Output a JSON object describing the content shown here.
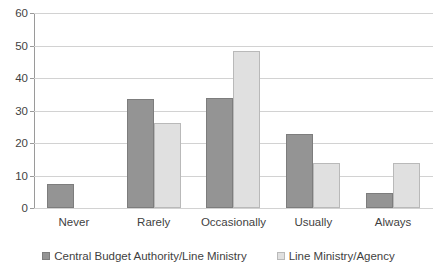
{
  "chart_data": {
    "type": "bar",
    "title": "",
    "xlabel": "",
    "ylabel": "",
    "ylim": [
      0,
      60
    ],
    "ytick_step": 10,
    "yticks": [
      0,
      10,
      20,
      30,
      40,
      50,
      60
    ],
    "grid": true,
    "legend_position": "bottom",
    "categories": [
      "Never",
      "Rarely",
      "Occasionally",
      "Usually",
      "Always"
    ],
    "series": [
      {
        "name": "Central Budget Authority/Line Ministry",
        "color": "#949494",
        "values": [
          7.5,
          33.5,
          34.0,
          22.8,
          4.5
        ]
      },
      {
        "name": "Line Ministry/Agency",
        "color": "#e0e0e0",
        "values": [
          0,
          26.3,
          48.3,
          13.7,
          13.8
        ]
      }
    ]
  },
  "legend": {
    "items": [
      {
        "label": "Central Budget Authority/Line Ministry",
        "swatch": "dark"
      },
      {
        "label": "Line Ministry/Agency",
        "swatch": "light"
      }
    ]
  }
}
